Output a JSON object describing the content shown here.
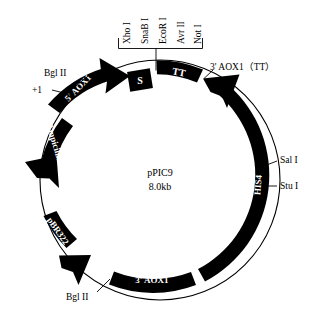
{
  "figure": {
    "name": "pPIC9 plasmid map",
    "center_title": "pPIC9",
    "center_size": "8.0kb",
    "background_color": "#ffffff",
    "segment_color": "#000000",
    "segment_text_color": "#ffffff"
  },
  "segments": {
    "aox1_5": "5' AOX1",
    "signal": "S",
    "tt": "TT",
    "his4": "HIS4",
    "aox1_3": "3' AOX1",
    "pbr322": "pBR322",
    "ampicillin": "Ampicillin"
  },
  "restriction_sites": {
    "bracket_items": [
      "Xho I",
      "SnaB I",
      "EcoR I",
      "Avr II",
      "Not I"
    ]
  },
  "callouts": {
    "bgl2_top": "Bgl II",
    "plus_one": "+1",
    "aox1_3_tt": "3' AOX1（TT）",
    "sal1": "Sal  I",
    "stu1": "Stu  I",
    "bgl2_bottom": "Bgl II"
  }
}
